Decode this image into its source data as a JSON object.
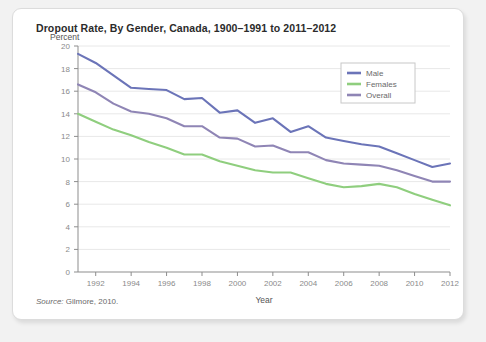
{
  "figure": {
    "title": "Dropout Rate, By Gender, Canada, 1900–1991 to 2011–2012",
    "source_label": "Source:",
    "source_text": " Gilmore, 2010."
  },
  "chart_data": {
    "type": "line",
    "title": "Dropout Rate, By Gender, Canada, 1900–1991 to 2011–2012",
    "xlabel": "Year",
    "ylabel": "Percent",
    "xlim": [
      1991,
      2012
    ],
    "ylim": [
      0,
      20
    ],
    "x_ticks": [
      1992,
      1994,
      1996,
      1998,
      2000,
      2002,
      2004,
      2006,
      2008,
      2010,
      2012
    ],
    "y_ticks": [
      0,
      2,
      4,
      6,
      8,
      10,
      12,
      14,
      16,
      18,
      20
    ],
    "grid": "horizontal",
    "legend_position": "top-right",
    "x": [
      1991,
      1992,
      1993,
      1994,
      1995,
      1996,
      1997,
      1998,
      1999,
      2000,
      2001,
      2002,
      2003,
      2004,
      2005,
      2006,
      2007,
      2008,
      2009,
      2010,
      2011,
      2012
    ],
    "series": [
      {
        "name": "Male",
        "color": "#6b74b8",
        "values": [
          19.3,
          18.5,
          17.4,
          16.3,
          16.2,
          16.1,
          15.3,
          15.4,
          14.1,
          14.3,
          13.2,
          13.6,
          12.4,
          12.9,
          11.9,
          11.6,
          11.3,
          11.1,
          10.5,
          9.9,
          9.3,
          9.6
        ]
      },
      {
        "name": "Females",
        "color": "#8fce7e",
        "values": [
          14.0,
          13.3,
          12.6,
          12.1,
          11.5,
          11.0,
          10.4,
          10.4,
          9.8,
          9.4,
          9.0,
          8.8,
          8.8,
          8.3,
          7.8,
          7.5,
          7.6,
          7.8,
          7.5,
          6.9,
          6.4,
          5.9
        ]
      },
      {
        "name": "Overall",
        "color": "#8f85b5",
        "values": [
          16.6,
          15.9,
          14.9,
          14.2,
          14.0,
          13.6,
          12.9,
          12.9,
          11.9,
          11.8,
          11.1,
          11.2,
          10.6,
          10.6,
          9.9,
          9.6,
          9.5,
          9.4,
          9.0,
          8.5,
          8.0,
          8.0
        ]
      }
    ]
  }
}
